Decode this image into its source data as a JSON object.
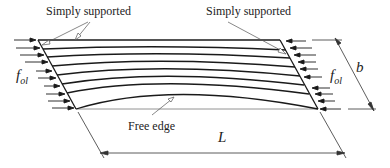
{
  "diagram": {
    "labels": {
      "support_left": "Simply supported",
      "support_right": "Simply supported",
      "free_edge": "Free edge",
      "length": "L",
      "width": "b",
      "load_left_main": "f",
      "load_left_sub": "ol",
      "load_right_main": "f",
      "load_right_sub": "ol"
    },
    "colors": {
      "line": "#1a1a1a",
      "leader": "#555555"
    }
  }
}
